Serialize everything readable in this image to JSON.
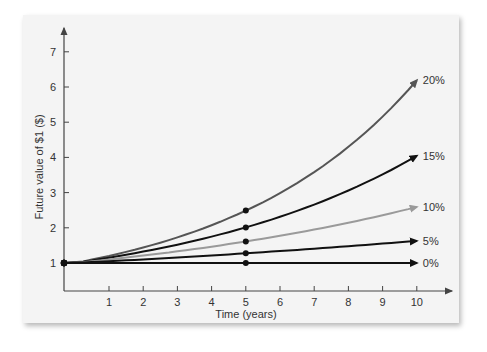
{
  "chart_data": {
    "type": "line",
    "title": "",
    "xlabel": "Time (years)",
    "ylabel": "Future value of $1 ($)",
    "x_ticks": [
      "1",
      "2",
      "3",
      "4",
      "5",
      "6",
      "7",
      "8",
      "9",
      "10"
    ],
    "y_ticks": [
      "1",
      "2",
      "3",
      "4",
      "5",
      "6",
      "7"
    ],
    "xlim": [
      0,
      10
    ],
    "ylim": [
      0,
      7
    ],
    "grid": false,
    "legend_position": "inline labels at line ends (right)",
    "x": [
      0,
      5,
      10
    ],
    "series": [
      {
        "name": "20%",
        "values": [
          1,
          2.49,
          6.19
        ],
        "color": "#555555",
        "marker_at": 5
      },
      {
        "name": "15%",
        "values": [
          1,
          2.01,
          4.05
        ],
        "color": "#111111",
        "marker_at": 5
      },
      {
        "name": "10%",
        "values": [
          1,
          1.61,
          2.59
        ],
        "color": "#9a9a9a",
        "marker_at": 5
      },
      {
        "name": "5%",
        "values": [
          1,
          1.28,
          1.63
        ],
        "color": "#111111",
        "marker_at": 5
      },
      {
        "name": "0%",
        "values": [
          1,
          1.0,
          1.0
        ],
        "color": "#111111",
        "marker_at": 5
      }
    ]
  }
}
